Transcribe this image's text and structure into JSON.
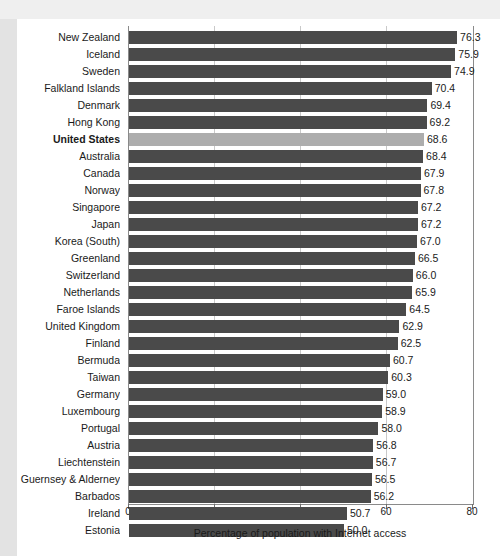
{
  "chart_data": {
    "type": "bar",
    "orientation": "horizontal",
    "title": "",
    "xlabel": "Percentage of population with Internet access",
    "ylabel": "",
    "xlim": [
      0,
      80
    ],
    "xticks": [
      0,
      20,
      40,
      60,
      80
    ],
    "xtick_labels": [
      "0",
      "20",
      "40",
      "60",
      "80"
    ],
    "grid": true,
    "grid_axis": "x",
    "legend": false,
    "value_label_format": "one-decimal",
    "highlight_category": "United States",
    "colors": {
      "bar": "#4a4a4a",
      "bar_highlight": "#adadad",
      "gridline": "#c9c9c9",
      "axis": "#8a8a8a",
      "text": "#1a1a1a",
      "page_background": "#e8e8e8",
      "plot_background": "#ffffff"
    },
    "categories": [
      "New Zealand",
      "Iceland",
      "Sweden",
      "Falkland Islands",
      "Denmark",
      "Hong Kong",
      "United States",
      "Australia",
      "Canada",
      "Norway",
      "Singapore",
      "Japan",
      "Korea (South)",
      "Greenland",
      "Switzerland",
      "Netherlands",
      "Faroe Islands",
      "United Kingdom",
      "Finland",
      "Bermuda",
      "Taiwan",
      "Germany",
      "Luxembourg",
      "Portugal",
      "Austria",
      "Liechtenstein",
      "Guernsey & Alderney",
      "Barbados",
      "Ireland",
      "Estonia"
    ],
    "values": [
      76.3,
      75.9,
      74.9,
      70.4,
      69.4,
      69.2,
      68.6,
      68.4,
      67.9,
      67.8,
      67.2,
      67.2,
      67.0,
      66.5,
      66.0,
      65.9,
      64.5,
      62.9,
      62.5,
      60.7,
      60.3,
      59.0,
      58.9,
      58.0,
      56.8,
      56.7,
      56.5,
      56.2,
      50.7,
      50.0
    ],
    "value_labels": [
      "76.3",
      "75.9",
      "74.9",
      "70.4",
      "69.4",
      "69.2",
      "68.6",
      "68.4",
      "67.9",
      "67.8",
      "67.2",
      "67.2",
      "67.0",
      "66.5",
      "66.0",
      "65.9",
      "64.5",
      "62.9",
      "62.5",
      "60.7",
      "60.3",
      "59.0",
      "58.9",
      "58.0",
      "56.8",
      "56.7",
      "56.5",
      "56.2",
      "50.7",
      "50.0"
    ]
  }
}
